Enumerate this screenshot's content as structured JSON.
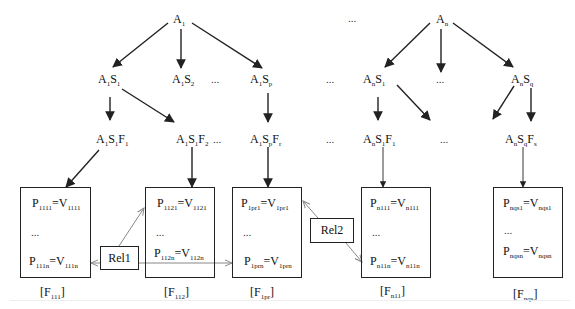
{
  "diagram": {
    "ellipsis": "...",
    "roots": [
      {
        "base": "A",
        "sub": "1"
      },
      {
        "base": "A",
        "sub": "n"
      }
    ],
    "level2": [
      {
        "parts": [
          [
            "A",
            "1"
          ],
          [
            "S",
            "1"
          ]
        ]
      },
      {
        "parts": [
          [
            "A",
            "1"
          ],
          [
            "S",
            "2"
          ]
        ]
      },
      {
        "parts": [
          [
            "A",
            "1"
          ],
          [
            "S",
            "p"
          ]
        ]
      },
      {
        "parts": [
          [
            "A",
            "n"
          ],
          [
            "S",
            "1"
          ]
        ]
      },
      {
        "parts": [
          [
            "A",
            "n"
          ],
          [
            "S",
            "q"
          ]
        ]
      }
    ],
    "level3": [
      {
        "parts": [
          [
            "A",
            "1"
          ],
          [
            "S",
            "1"
          ],
          [
            "F",
            "1"
          ]
        ]
      },
      {
        "parts": [
          [
            "A",
            "1"
          ],
          [
            "S",
            "1"
          ],
          [
            "F",
            "2"
          ]
        ]
      },
      {
        "parts": [
          [
            "A",
            "1"
          ],
          [
            "S",
            "p"
          ],
          [
            "F",
            "r"
          ]
        ]
      },
      {
        "parts": [
          [
            "A",
            "n"
          ],
          [
            "S",
            "1"
          ],
          [
            "F",
            "1"
          ]
        ]
      },
      {
        "parts": [
          [
            "A",
            "n"
          ],
          [
            "S",
            "q"
          ],
          [
            "F",
            "s"
          ]
        ]
      }
    ],
    "frames": [
      {
        "caption": {
          "base": "[F",
          "sub": "111",
          "close": "]"
        },
        "first": {
          "p": "1111",
          "v": "1111"
        },
        "last": {
          "p": "111n",
          "v": "111n"
        }
      },
      {
        "caption": {
          "base": "[F",
          "sub": "112",
          "close": "]"
        },
        "first": {
          "p": "1121",
          "v": "1121"
        },
        "last": {
          "p": "112n",
          "v": "112n"
        }
      },
      {
        "caption": {
          "base": "[F",
          "sub": "1pr",
          "close": "]"
        },
        "first": {
          "p": "1pr1",
          "v": "1pr1"
        },
        "last": {
          "p": "1prn",
          "v": "1prn"
        }
      },
      {
        "caption": {
          "base": "[F",
          "sub": "n11",
          "close": "]"
        },
        "first": {
          "p": "n111",
          "v": "n111"
        },
        "last": {
          "p": "n11n",
          "v": "n11n"
        }
      },
      {
        "caption": {
          "base": "[F",
          "sub": "nqs",
          "close": "]"
        },
        "first": {
          "p": "nqs1",
          "v": "nqs1"
        },
        "last": {
          "p": "nqsn",
          "v": "nqsn"
        }
      }
    ],
    "relations": [
      {
        "label": "Rel1"
      },
      {
        "label": "Rel2"
      }
    ],
    "prop_symbol": "P",
    "value_symbol": "V",
    "equals": "=",
    "colors": {
      "line": "#222222",
      "relation_line": "#888888",
      "background": "#ffffff"
    }
  }
}
